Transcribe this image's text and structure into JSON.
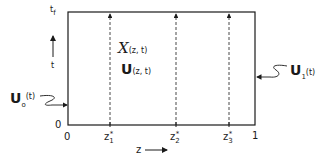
{
  "diagram": {
    "type": "space-time domain",
    "axes": {
      "time_top_label": "t",
      "time_top_sub": "f",
      "time_label": "t",
      "origin_left": "0",
      "origin_bottom": "0",
      "z_axis_label": "z",
      "z_end": "1"
    },
    "interior": {
      "state_main": "X",
      "state_args": "(z, t)",
      "control_main": "U",
      "control_args": "(z, t)"
    },
    "boundary_inputs": {
      "left_main": "U",
      "left_sub": "o",
      "left_args": "(t)",
      "right_main": "U",
      "right_sub": "1",
      "right_args": "(t)"
    },
    "dashed_lines": [
      {
        "label": "z",
        "sub": "1",
        "sup": "*"
      },
      {
        "label": "z",
        "sub": "2",
        "sup": "*"
      },
      {
        "label": "z",
        "sub": "3",
        "sup": "*"
      }
    ],
    "colors": {
      "ink": "#1a1a1a",
      "background": "#ffffff"
    }
  }
}
